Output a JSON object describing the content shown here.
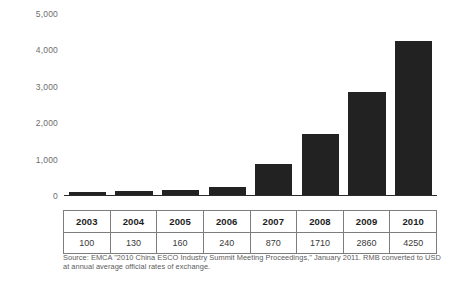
{
  "chart_data": {
    "type": "bar",
    "title": "",
    "subtitle": "",
    "xlabel": "",
    "ylabel": "",
    "categories": [
      "2003",
      "2004",
      "2005",
      "2006",
      "2007",
      "2008",
      "2009",
      "2010"
    ],
    "values": [
      100,
      130,
      160,
      240,
      870,
      1710,
      2860,
      4250
    ],
    "series": [
      {
        "name": "",
        "values": [
          100,
          130,
          160,
          240,
          870,
          1710,
          2860,
          4250
        ],
        "color": "#222222"
      }
    ],
    "ylim": [
      0,
      5000
    ],
    "yticks": [
      0,
      1000,
      2000,
      3000,
      4000,
      5000
    ],
    "ytick_labels": [
      "0",
      "1,000",
      "2,000",
      "3,000",
      "4,000",
      "5,000"
    ],
    "grid": false,
    "legend": false,
    "legend_position": "none",
    "bar_color": "#222222",
    "axis_color": "#2b2b2b"
  },
  "table": {
    "header": [
      "2003",
      "2004",
      "2005",
      "2006",
      "2007",
      "2008",
      "2009",
      "2010"
    ],
    "values": [
      "100",
      "130",
      "160",
      "240",
      "870",
      "1710",
      "2860",
      "4250"
    ]
  },
  "source": {
    "note": "Source: EMCA \"2010 China ESCO Industry Summit Meeting Proceedings,\" January 2011. RMB converted to USD at annual average official rates of exchange."
  }
}
